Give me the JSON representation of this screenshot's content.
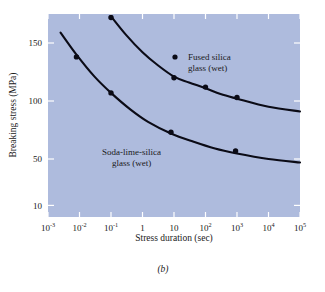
{
  "figure": {
    "caption": "(b)"
  },
  "chart_data": {
    "type": "line",
    "title": "",
    "xlabel": "Stress duration (sec)",
    "ylabel": "Breaking stress (MPa)",
    "xscale": "log",
    "yscale": "linear",
    "xlim": [
      0.001,
      100000
    ],
    "ylim": [
      0,
      175
    ],
    "grid": false,
    "legend_position": "inline-annotation",
    "xticks": [
      {
        "value": 0.001,
        "base": "10",
        "exp": "-3"
      },
      {
        "value": 0.01,
        "base": "10",
        "exp": "-2"
      },
      {
        "value": 0.1,
        "base": "10",
        "exp": "-1"
      },
      {
        "value": 1,
        "base": "1",
        "exp": ""
      },
      {
        "value": 10,
        "base": "10",
        "exp": ""
      },
      {
        "value": 100,
        "base": "10",
        "exp": "2"
      },
      {
        "value": 1000,
        "base": "10",
        "exp": "3"
      },
      {
        "value": 10000,
        "base": "10",
        "exp": "4"
      },
      {
        "value": 100000,
        "base": "10",
        "exp": "5"
      }
    ],
    "yticks": [
      {
        "value": 150,
        "label": "150"
      },
      {
        "value": 100,
        "label": "100"
      },
      {
        "value": 50,
        "label": "50"
      },
      {
        "value": 10,
        "label": "10"
      }
    ],
    "series": [
      {
        "name": "Fused silica glass (wet)",
        "annotation_line1": "Fused silica",
        "annotation_line2": "glass (wet)",
        "color": "#0b0b16",
        "points": [
          {
            "x": 0.1,
            "y": 172
          },
          {
            "x": 10,
            "y": 120
          },
          {
            "x": 100,
            "y": 112
          },
          {
            "x": 1000,
            "y": 103
          }
        ],
        "curve": [
          {
            "x": 0.1,
            "y": 173
          },
          {
            "x": 0.3,
            "y": 157
          },
          {
            "x": 1,
            "y": 142
          },
          {
            "x": 3,
            "y": 131
          },
          {
            "x": 10,
            "y": 121
          },
          {
            "x": 30,
            "y": 116
          },
          {
            "x": 100,
            "y": 111
          },
          {
            "x": 300,
            "y": 106
          },
          {
            "x": 1000,
            "y": 102
          },
          {
            "x": 10000,
            "y": 95
          },
          {
            "x": 100000,
            "y": 91
          }
        ]
      },
      {
        "name": "Soda-lime-silica glass (wet)",
        "annotation_line1": "Soda-lime-silica",
        "annotation_line2": "glass (wet)",
        "color": "#0b0b16",
        "points": [
          {
            "x": 0.008,
            "y": 138
          },
          {
            "x": 0.1,
            "y": 107
          },
          {
            "x": 8,
            "y": 73
          },
          {
            "x": 900,
            "y": 57
          }
        ],
        "curve": [
          {
            "x": 0.0025,
            "y": 159
          },
          {
            "x": 0.008,
            "y": 140
          },
          {
            "x": 0.03,
            "y": 121
          },
          {
            "x": 0.1,
            "y": 107
          },
          {
            "x": 0.4,
            "y": 93
          },
          {
            "x": 1.5,
            "y": 82
          },
          {
            "x": 8,
            "y": 72
          },
          {
            "x": 40,
            "y": 65
          },
          {
            "x": 200,
            "y": 59
          },
          {
            "x": 900,
            "y": 55
          },
          {
            "x": 10000,
            "y": 50
          },
          {
            "x": 100000,
            "y": 47
          }
        ]
      }
    ]
  }
}
